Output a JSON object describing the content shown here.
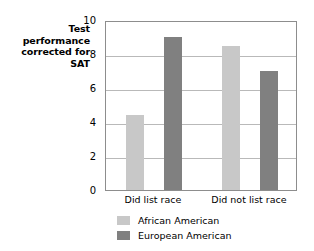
{
  "chart_data": {
    "type": "bar",
    "title": "",
    "xlabel": "",
    "ylabel": "Test performance corrected for SAT",
    "ylim": [
      0,
      10
    ],
    "ytick_labels": [
      "0",
      "2",
      "4",
      "6",
      "8",
      "10"
    ],
    "ytick_values": [
      0,
      2,
      4,
      6,
      8,
      10
    ],
    "grid": true,
    "legend_position": "bottom-left",
    "categories": [
      "Did list race",
      "Did not list race"
    ],
    "series": [
      {
        "name": "African American",
        "color": "#c8c8c8",
        "values": [
          4.4,
          8.5
        ]
      },
      {
        "name": "European American",
        "color": "#808080",
        "values": [
          9.0,
          7.0
        ]
      }
    ]
  },
  "axis": {
    "y_title_lines": [
      "Test",
      "performance",
      "corrected for",
      "SAT"
    ],
    "y_title_text": "Test performance corrected for SAT",
    "frame_color": "#8d8d8d",
    "gridline_color": "#b9b9b9"
  },
  "ticks": {
    "y": [
      {
        "label": "10",
        "value": 10
      },
      {
        "label": "8",
        "value": 8
      },
      {
        "label": "6",
        "value": 6
      },
      {
        "label": "4",
        "value": 4
      },
      {
        "label": "2",
        "value": 2
      },
      {
        "label": "0",
        "value": 0
      }
    ],
    "x": [
      {
        "label": "Did list race"
      },
      {
        "label": "Did not list race"
      }
    ]
  },
  "legend": {
    "items": [
      {
        "label": "African American",
        "color": "#c8c8c8"
      },
      {
        "label": "European American",
        "color": "#808080"
      }
    ]
  }
}
